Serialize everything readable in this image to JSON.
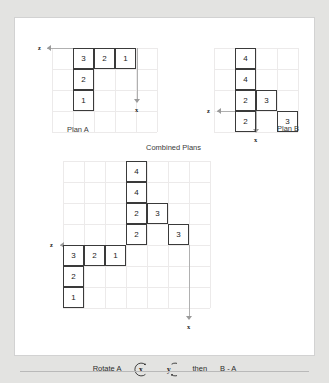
{
  "page": {
    "background": "#e3e3e1",
    "card_background": "#ffffff",
    "cell_border_color": "#3a3a3a",
    "grid_line_color": "#eceaea",
    "axis_color": "#b0b0b0"
  },
  "plan_a": {
    "caption": "Plan A",
    "axis_z_label": "z",
    "axis_x_label": "x",
    "cells": [
      {
        "value": "3",
        "col": 0,
        "row": 0
      },
      {
        "value": "2",
        "col": 1,
        "row": 0
      },
      {
        "value": "1",
        "col": 2,
        "row": 0
      },
      {
        "value": "2",
        "col": 0,
        "row": 1
      },
      {
        "value": "1",
        "col": 0,
        "row": 2
      }
    ]
  },
  "plan_b": {
    "caption": "Plan B",
    "axis_z_label": "z",
    "axis_x_label": "x",
    "cells": [
      {
        "value": "4",
        "col": 0,
        "row": 0
      },
      {
        "value": "4",
        "col": 0,
        "row": 1
      },
      {
        "value": "2",
        "col": 0,
        "row": 2
      },
      {
        "value": "3",
        "col": 1,
        "row": 2
      },
      {
        "value": "2",
        "col": 0,
        "row": 3
      },
      {
        "value": "3",
        "col": 2,
        "row": 3
      }
    ]
  },
  "combined": {
    "title": "Combined Plans",
    "axis_z_label": "z",
    "axis_x_label": "x",
    "cells": [
      {
        "value": "4",
        "col": 3,
        "row": 0
      },
      {
        "value": "4",
        "col": 3,
        "row": 1
      },
      {
        "value": "2",
        "col": 3,
        "row": 2
      },
      {
        "value": "3",
        "col": 4,
        "row": 2
      },
      {
        "value": "2",
        "col": 3,
        "row": 3
      },
      {
        "value": "3",
        "col": 5,
        "row": 3
      },
      {
        "value": "3",
        "col": 0,
        "row": 4
      },
      {
        "value": "2",
        "col": 1,
        "row": 4
      },
      {
        "value": "1",
        "col": 2,
        "row": 4
      },
      {
        "value": "2",
        "col": 0,
        "row": 5
      },
      {
        "value": "1",
        "col": 0,
        "row": 6
      }
    ]
  },
  "footer": {
    "rotate_label": "Rotate A",
    "axis_1": "x",
    "axis_2": "y",
    "then_label": "then",
    "operation": "B - A"
  }
}
